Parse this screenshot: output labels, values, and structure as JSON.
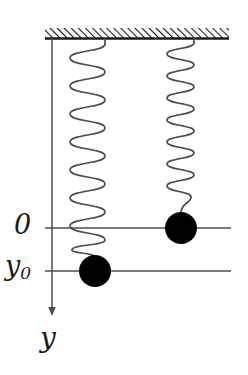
{
  "figure": {
    "background_color": "#ffffff",
    "line_color": "#4d4d4d",
    "mass_color": "#000000",
    "axis_color": "#4d4d4d",
    "ceiling_color": "#1a1a1a"
  },
  "labels": {
    "origin": "0",
    "displacement_symbol": "y",
    "displacement_subscript": "0",
    "axis": "y"
  },
  "ceiling": {
    "name": "hatched-support",
    "x_start": 45,
    "x_end": 229,
    "y": 38,
    "hatch_angle_deg": 45,
    "hatch_count": 46
  },
  "axis": {
    "name": "y-axis",
    "x": 52,
    "y_top": 38,
    "y_bottom": 313,
    "direction": "down",
    "arrow": true
  },
  "reference_lines": [
    {
      "name": "zero-line",
      "label": "0",
      "y": 228,
      "x_start": 45,
      "x_end": 231
    },
    {
      "name": "y0-line",
      "label": "y0",
      "y": 271,
      "x_start": 45,
      "x_end": 231
    }
  ],
  "springs": [
    {
      "name": "left-spring",
      "state": "stretched",
      "x_center": 88,
      "coil_radius_x": 18,
      "y_top": 40,
      "y_coils_end": 243,
      "coils": 14,
      "tail_to_mass_y": 256
    },
    {
      "name": "right-spring",
      "state": "relaxed",
      "x_center": 181,
      "coil_radius_x": 14,
      "y_top": 40,
      "y_coils_end": 197,
      "coils": 14,
      "tail_to_mass_y": 213
    }
  ],
  "masses": [
    {
      "name": "left-mass",
      "cx": 95,
      "cy": 271,
      "r": 16,
      "position_label": "y0"
    },
    {
      "name": "right-mass",
      "cx": 181,
      "cy": 228,
      "r": 16,
      "position_label": "0"
    }
  ]
}
